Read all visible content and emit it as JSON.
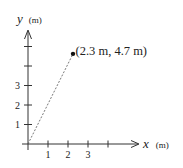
{
  "diagram": {
    "type": "position-vector-diagram",
    "x_axis": {
      "variable": "x",
      "unit": "(m)",
      "tick_values": [
        1,
        2,
        3,
        4
      ],
      "tick_labels": [
        "1",
        "2",
        "3",
        ""
      ]
    },
    "y_axis": {
      "variable": "y",
      "unit": "(m)",
      "tick_values": [
        1,
        2,
        3,
        4,
        5
      ],
      "tick_labels": [
        "1",
        "2",
        "3",
        "",
        ""
      ]
    },
    "point": {
      "x": 2.3,
      "y": 4.7,
      "label": "(2.3 m, 4.7 m)"
    },
    "line": {
      "from": [
        0,
        0
      ],
      "to": [
        2.3,
        4.7
      ],
      "style": "dashed"
    },
    "colors": {
      "ink": "#333333",
      "background": "#ffffff"
    }
  }
}
